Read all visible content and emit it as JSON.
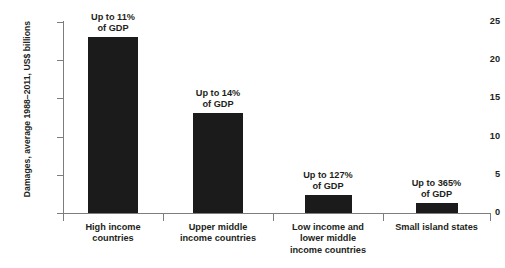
{
  "chart_data": {
    "type": "bar",
    "title": "",
    "subtitle": "",
    "xlabel": "",
    "ylabel": "Damages, average 1988–2011, US$ billions",
    "ylim": [
      0,
      25
    ],
    "yticks": [
      0,
      5,
      10,
      15,
      20,
      25
    ],
    "ytick_labels": [
      "0",
      "5",
      "10",
      "15",
      "20",
      "25"
    ],
    "grid": false,
    "legend": "none",
    "bar_color": "#1b1b1b",
    "axis_color": "#7d7d7d",
    "categories": [
      "High income countries",
      "Upper middle income countries",
      "Low income and lower middle income countries",
      "Small island states"
    ],
    "category_label_lines": [
      [
        "High income",
        "countries"
      ],
      [
        "Upper middle",
        "income countries"
      ],
      [
        "Low income and",
        "lower middle",
        "income countries"
      ],
      [
        "Small island states"
      ]
    ],
    "values": [
      23.0,
      13.1,
      2.35,
      1.3
    ],
    "annotations": [
      {
        "line1": "Up to 11%",
        "line2": "of GDP"
      },
      {
        "line1": "Up to 14%",
        "line2": "of GDP"
      },
      {
        "line1": "Up to 127%",
        "line2": "of GDP"
      },
      {
        "line1": "Up to 365%",
        "line2": "of GDP"
      }
    ]
  }
}
